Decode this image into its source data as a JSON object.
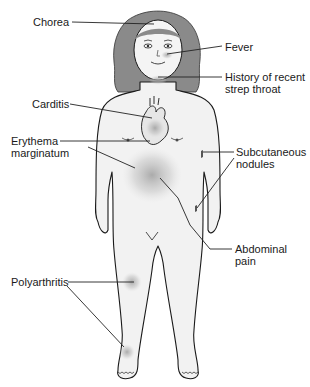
{
  "diagram": {
    "labels": [
      {
        "id": "chorea",
        "text": "Chorea",
        "x": 33,
        "y": 16
      },
      {
        "id": "fever",
        "text": "Fever",
        "x": 225,
        "y": 41
      },
      {
        "id": "strep",
        "text": "History of recent\nstrep throat",
        "x": 225,
        "y": 74
      },
      {
        "id": "carditis",
        "text": "Carditis",
        "x": 32,
        "y": 97
      },
      {
        "id": "erythema",
        "text": "Erythema\nmarginatum",
        "x": 11,
        "y": 135
      },
      {
        "id": "nodules",
        "text": "Subcutaneous\nnodules",
        "x": 236,
        "y": 149
      },
      {
        "id": "abdominal",
        "text": "Abdominal\npain",
        "x": 235,
        "y": 244
      },
      {
        "id": "polyarthritis",
        "text": "Polyarthritis",
        "x": 11,
        "y": 276
      }
    ],
    "colors": {
      "outline": "#1a1a1a",
      "hair": "#8a8a8a",
      "skin": "#f2f2f2",
      "highlight": "#b5b5b5",
      "leader": "#222222"
    }
  }
}
